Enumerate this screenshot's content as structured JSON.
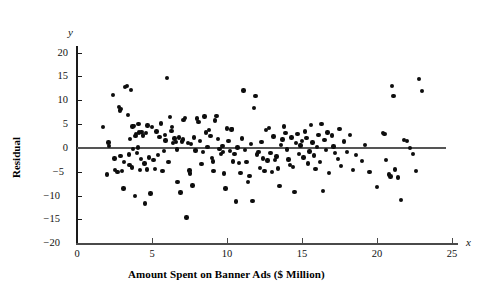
{
  "chart_data": {
    "type": "scatter",
    "title": "",
    "xlabel": "Amount Spent on Banner Ads ($ Million)",
    "ylabel": "Residual",
    "x_axis_symbol": "x",
    "y_axis_symbol": "y",
    "xlim": [
      0,
      25
    ],
    "ylim": [
      -20,
      20
    ],
    "xticks": [
      0,
      5,
      10,
      15,
      20,
      25
    ],
    "yticks": [
      20,
      15,
      10,
      5,
      0,
      -5,
      -10,
      -15,
      -20
    ],
    "xtick_labels": [
      "0",
      "5",
      "10",
      "15",
      "20",
      "25"
    ],
    "ytick_labels": [
      "20",
      "15",
      "10",
      "5",
      "0",
      "−5",
      "−10",
      "−15",
      "−20"
    ],
    "grid": false,
    "legend": false,
    "reference_line": {
      "y": 0,
      "x_start": 0,
      "x_end": 24.6,
      "color": "#555555"
    },
    "marker": {
      "shape": "circle",
      "color": "#0d0d0d",
      "size_px": 4.4
    },
    "point_count": 196,
    "points": [
      [
        1.75,
        4.4
      ],
      [
        2.1,
        1.2
      ],
      [
        2.0,
        -5.6
      ],
      [
        2.15,
        0.4
      ],
      [
        2.4,
        11.1
      ],
      [
        2.5,
        -2.2
      ],
      [
        2.55,
        -4.6
      ],
      [
        2.7,
        -5.0
      ],
      [
        2.8,
        8.6
      ],
      [
        2.85,
        7.9
      ],
      [
        2.9,
        -1.7
      ],
      [
        2.95,
        8.2
      ],
      [
        3.0,
        -4.9
      ],
      [
        3.1,
        -8.5
      ],
      [
        3.15,
        -3.0
      ],
      [
        3.2,
        12.9
      ],
      [
        3.35,
        13.1
      ],
      [
        3.4,
        6.9
      ],
      [
        3.45,
        -1.4
      ],
      [
        3.5,
        -3.6
      ],
      [
        3.55,
        1.9
      ],
      [
        3.6,
        12.2
      ],
      [
        3.65,
        -4.1
      ],
      [
        3.7,
        4.5
      ],
      [
        3.75,
        -0.2
      ],
      [
        3.8,
        4.6
      ],
      [
        3.85,
        -10.1
      ],
      [
        3.9,
        2.5
      ],
      [
        3.95,
        3.0
      ],
      [
        4.0,
        -1.0
      ],
      [
        4.05,
        0.1
      ],
      [
        4.1,
        5.0
      ],
      [
        4.15,
        3.3
      ],
      [
        4.2,
        -4.6
      ],
      [
        4.25,
        -2.3
      ],
      [
        4.3,
        3.4
      ],
      [
        4.4,
        2.6
      ],
      [
        4.5,
        -3.3
      ],
      [
        4.55,
        -11.7
      ],
      [
        4.6,
        3.1
      ],
      [
        4.65,
        -4.5
      ],
      [
        4.7,
        4.7
      ],
      [
        4.8,
        -2.0
      ],
      [
        4.9,
        -9.6
      ],
      [
        5.0,
        4.4
      ],
      [
        5.1,
        -2.5
      ],
      [
        5.2,
        -4.4
      ],
      [
        5.3,
        3.5
      ],
      [
        5.4,
        -1.5
      ],
      [
        5.5,
        2.3
      ],
      [
        5.6,
        5.2
      ],
      [
        5.7,
        -4.8
      ],
      [
        5.8,
        -0.6
      ],
      [
        5.85,
        2.8
      ],
      [
        5.9,
        1.6
      ],
      [
        6.0,
        14.7
      ],
      [
        6.1,
        -2.9
      ],
      [
        6.2,
        6.5
      ],
      [
        6.3,
        3.6
      ],
      [
        6.35,
        4.4
      ],
      [
        6.4,
        1.0
      ],
      [
        6.5,
        2.0
      ],
      [
        6.6,
        1.3
      ],
      [
        6.65,
        -0.3
      ],
      [
        6.7,
        -7.2
      ],
      [
        6.8,
        2.2
      ],
      [
        6.9,
        -9.4
      ],
      [
        7.0,
        1.4
      ],
      [
        7.05,
        1.8
      ],
      [
        7.1,
        5.9
      ],
      [
        7.2,
        6.3
      ],
      [
        7.3,
        -14.6
      ],
      [
        7.4,
        1.1
      ],
      [
        7.5,
        -4.7
      ],
      [
        7.55,
        -5.4
      ],
      [
        7.6,
        0.9
      ],
      [
        7.7,
        -7.9
      ],
      [
        7.8,
        2.2
      ],
      [
        7.9,
        -0.5
      ],
      [
        8.0,
        6.2
      ],
      [
        8.1,
        5.5
      ],
      [
        8.2,
        1.5
      ],
      [
        8.3,
        -3.4
      ],
      [
        8.4,
        -0.8
      ],
      [
        8.5,
        6.6
      ],
      [
        8.6,
        3.3
      ],
      [
        8.7,
        0.2
      ],
      [
        8.8,
        3.8
      ],
      [
        8.9,
        2.5
      ],
      [
        9.0,
        -2.1
      ],
      [
        9.05,
        -2.8
      ],
      [
        9.1,
        -4.9
      ],
      [
        9.2,
        5.8
      ],
      [
        9.3,
        6.8
      ],
      [
        9.4,
        1.9
      ],
      [
        9.5,
        -0.2
      ],
      [
        9.6,
        -1.2
      ],
      [
        9.7,
        0.4
      ],
      [
        9.75,
        -0.9
      ],
      [
        9.8,
        -5.4
      ],
      [
        9.9,
        -8.5
      ],
      [
        10.0,
        4.1
      ],
      [
        10.1,
        1.5
      ],
      [
        10.2,
        -0.6
      ],
      [
        10.3,
        3.9
      ],
      [
        10.35,
        4.0
      ],
      [
        10.4,
        -2.8
      ],
      [
        10.5,
        -1.3
      ],
      [
        10.6,
        -11.3
      ],
      [
        10.7,
        0.1
      ],
      [
        10.8,
        -3.1
      ],
      [
        10.9,
        -5.2
      ],
      [
        11.0,
        2.0
      ],
      [
        11.1,
        12.1
      ],
      [
        11.2,
        -0.4
      ],
      [
        11.3,
        -3.0
      ],
      [
        11.4,
        -7.1
      ],
      [
        11.5,
        -5.9
      ],
      [
        11.6,
        0.8
      ],
      [
        11.7,
        -11.2
      ],
      [
        11.8,
        8.4
      ],
      [
        11.9,
        10.9
      ],
      [
        12.0,
        -1.4
      ],
      [
        12.1,
        -0.9
      ],
      [
        12.2,
        -4.2
      ],
      [
        12.3,
        1.3
      ],
      [
        12.4,
        -2.2
      ],
      [
        12.5,
        -4.8
      ],
      [
        12.6,
        3.8
      ],
      [
        12.7,
        -2.6
      ],
      [
        12.8,
        4.2
      ],
      [
        12.9,
        -1.0
      ],
      [
        13.0,
        -5.0
      ],
      [
        13.1,
        2.4
      ],
      [
        13.2,
        -2.5
      ],
      [
        13.3,
        -1.8
      ],
      [
        13.4,
        -4.3
      ],
      [
        13.5,
        -8.0
      ],
      [
        13.6,
        0.6
      ],
      [
        13.7,
        1.8
      ],
      [
        13.8,
        4.5
      ],
      [
        13.9,
        3.1
      ],
      [
        14.0,
        -0.3
      ],
      [
        14.1,
        -2.4
      ],
      [
        14.2,
        -3.6
      ],
      [
        14.3,
        2.2
      ],
      [
        14.4,
        -4.0
      ],
      [
        14.5,
        -9.2
      ],
      [
        14.6,
        1.0
      ],
      [
        14.7,
        2.9
      ],
      [
        14.8,
        -1.2
      ],
      [
        14.9,
        0.5
      ],
      [
        15.0,
        1.5
      ],
      [
        15.1,
        -2.0
      ],
      [
        15.2,
        3.5
      ],
      [
        15.3,
        2.1
      ],
      [
        15.4,
        -3.3
      ],
      [
        15.5,
        -0.7
      ],
      [
        15.6,
        4.8
      ],
      [
        15.7,
        1.2
      ],
      [
        15.8,
        -1.6
      ],
      [
        15.9,
        -4.4
      ],
      [
        16.0,
        0.2
      ],
      [
        16.1,
        2.7
      ],
      [
        16.2,
        -2.9
      ],
      [
        16.3,
        5.1
      ],
      [
        16.4,
        -9.0
      ],
      [
        16.5,
        1.7
      ],
      [
        16.6,
        -0.4
      ],
      [
        16.7,
        3.3
      ],
      [
        16.8,
        -5.3
      ],
      [
        17.0,
        2.6
      ],
      [
        17.1,
        0.3
      ],
      [
        17.2,
        -1.1
      ],
      [
        17.4,
        -2.3
      ],
      [
        17.5,
        4.0
      ],
      [
        17.6,
        -3.8
      ],
      [
        17.8,
        1.4
      ],
      [
        18.0,
        -0.9
      ],
      [
        18.2,
        2.8
      ],
      [
        18.4,
        -4.6
      ],
      [
        18.6,
        -1.5
      ],
      [
        19.0,
        -2.7
      ],
      [
        19.2,
        0.6
      ],
      [
        19.5,
        -5.1
      ],
      [
        20.0,
        -8.2
      ],
      [
        20.4,
        3.1
      ],
      [
        20.5,
        2.9
      ],
      [
        20.6,
        -2.5
      ],
      [
        20.8,
        -5.6
      ],
      [
        20.9,
        -6.0
      ],
      [
        21.0,
        13.0
      ],
      [
        21.1,
        11.0
      ],
      [
        21.2,
        -4.5
      ],
      [
        21.4,
        -6.2
      ],
      [
        21.6,
        -11.0
      ],
      [
        21.8,
        1.7
      ],
      [
        22.0,
        1.5
      ],
      [
        22.2,
        0.0
      ],
      [
        22.4,
        -1.3
      ],
      [
        22.6,
        -4.8
      ],
      [
        22.8,
        14.5
      ],
      [
        23.0,
        12.0
      ]
    ]
  }
}
